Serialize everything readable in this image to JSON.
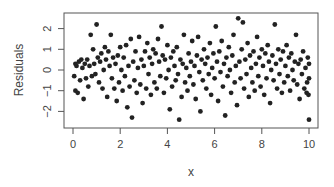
{
  "chart_data": {
    "type": "scatter",
    "title": "",
    "xlabel": "x",
    "ylabel": "Residuals",
    "xlim": [
      -0.4,
      10.4
    ],
    "ylim": [
      -2.8,
      2.8
    ],
    "xticks": [
      0,
      2,
      4,
      6,
      8,
      10
    ],
    "yticks": [
      -2,
      -1,
      0,
      1,
      2
    ],
    "grid": false,
    "legend": null,
    "marker_color": "#222222",
    "series": [
      {
        "name": "residuals",
        "points": [
          [
            0.05,
            -0.3
          ],
          [
            0.1,
            0.3
          ],
          [
            0.1,
            -1.0
          ],
          [
            0.15,
            0.2
          ],
          [
            0.2,
            -1.1
          ],
          [
            0.25,
            0.4
          ],
          [
            0.3,
            -0.5
          ],
          [
            0.35,
            0.5
          ],
          [
            0.4,
            0.1
          ],
          [
            0.45,
            -1.4
          ],
          [
            0.5,
            0.3
          ],
          [
            0.55,
            -0.4
          ],
          [
            0.6,
            0.5
          ],
          [
            0.65,
            -0.8
          ],
          [
            0.7,
            0.2
          ],
          [
            0.75,
            1.7
          ],
          [
            0.8,
            -0.3
          ],
          [
            0.85,
            1.0
          ],
          [
            0.9,
            0.3
          ],
          [
            0.95,
            -0.2
          ],
          [
            1.0,
            2.2
          ],
          [
            1.05,
            0.6
          ],
          [
            1.1,
            -0.6
          ],
          [
            1.15,
            0.4
          ],
          [
            1.2,
            0.8
          ],
          [
            1.25,
            -0.9
          ],
          [
            1.3,
            0.0
          ],
          [
            1.35,
            1.1
          ],
          [
            1.4,
            0.5
          ],
          [
            1.45,
            -1.3
          ],
          [
            1.5,
            0.9
          ],
          [
            1.55,
            0.2
          ],
          [
            1.6,
            1.7
          ],
          [
            1.65,
            -0.4
          ],
          [
            1.7,
            0.6
          ],
          [
            1.75,
            -0.9
          ],
          [
            1.8,
            0.3
          ],
          [
            1.85,
            -1.5
          ],
          [
            1.9,
            0.7
          ],
          [
            1.95,
            -0.6
          ],
          [
            2.0,
            1.1
          ],
          [
            2.05,
            0.0
          ],
          [
            2.1,
            -1.0
          ],
          [
            2.15,
            0.6
          ],
          [
            2.2,
            -0.3
          ],
          [
            2.25,
            1.2
          ],
          [
            2.3,
            -1.8
          ],
          [
            2.35,
            0.2
          ],
          [
            2.4,
            -0.8
          ],
          [
            2.45,
            1.5
          ],
          [
            2.5,
            -2.3
          ],
          [
            2.55,
            0.4
          ],
          [
            2.6,
            -0.5
          ],
          [
            2.65,
            0.9
          ],
          [
            2.7,
            -1.1
          ],
          [
            2.75,
            0.1
          ],
          [
            2.8,
            1.6
          ],
          [
            2.85,
            -0.7
          ],
          [
            2.9,
            0.5
          ],
          [
            2.95,
            -1.6
          ],
          [
            3.0,
            0.2
          ],
          [
            3.05,
            0.9
          ],
          [
            3.1,
            -0.9
          ],
          [
            3.15,
            1.3
          ],
          [
            3.2,
            -0.2
          ],
          [
            3.25,
            0.6
          ],
          [
            3.3,
            -1.2
          ],
          [
            3.35,
            0.3
          ],
          [
            3.4,
            1.0
          ],
          [
            3.45,
            -0.6
          ],
          [
            3.5,
            0.8
          ],
          [
            3.55,
            -0.9
          ],
          [
            3.6,
            1.5
          ],
          [
            3.65,
            0.4
          ],
          [
            3.7,
            -0.3
          ],
          [
            3.75,
            2.1
          ],
          [
            3.8,
            0.7
          ],
          [
            3.85,
            -1.1
          ],
          [
            3.9,
            0.5
          ],
          [
            3.95,
            -0.4
          ],
          [
            4.0,
            1.2
          ],
          [
            4.05,
            0.0
          ],
          [
            4.1,
            -1.9
          ],
          [
            4.15,
            0.6
          ],
          [
            4.2,
            -0.8
          ],
          [
            4.25,
            0.9
          ],
          [
            4.3,
            0.2
          ],
          [
            4.35,
            -0.5
          ],
          [
            4.4,
            1.1
          ],
          [
            4.45,
            -0.2
          ],
          [
            4.5,
            -2.4
          ],
          [
            4.55,
            0.5
          ],
          [
            4.6,
            -1.3
          ],
          [
            4.65,
            0.3
          ],
          [
            4.7,
            1.7
          ],
          [
            4.75,
            -0.6
          ],
          [
            4.8,
            0.1
          ],
          [
            4.85,
            -1.0
          ],
          [
            4.9,
            0.8
          ],
          [
            4.95,
            -0.3
          ],
          [
            5.0,
            0.4
          ],
          [
            5.05,
            1.4
          ],
          [
            5.1,
            -0.7
          ],
          [
            5.15,
            0.2
          ],
          [
            5.2,
            -1.4
          ],
          [
            5.25,
            0.7
          ],
          [
            5.3,
            1.6
          ],
          [
            5.35,
            -0.1
          ],
          [
            5.4,
            -2.0
          ],
          [
            5.45,
            0.5
          ],
          [
            5.5,
            -0.5
          ],
          [
            5.55,
            1.0
          ],
          [
            5.6,
            0.3
          ],
          [
            5.65,
            -0.9
          ],
          [
            5.7,
            0.6
          ],
          [
            5.75,
            -0.2
          ],
          [
            5.8,
            1.3
          ],
          [
            5.85,
            -1.2
          ],
          [
            5.9,
            0.1
          ],
          [
            5.95,
            0.8
          ],
          [
            6.0,
            -0.4
          ],
          [
            6.05,
            2.1
          ],
          [
            6.1,
            0.4
          ],
          [
            6.15,
            -1.5
          ],
          [
            6.2,
            0.9
          ],
          [
            6.25,
            -0.1
          ],
          [
            6.3,
            1.4
          ],
          [
            6.35,
            -0.8
          ],
          [
            6.4,
            0.3
          ],
          [
            6.45,
            -2.2
          ],
          [
            6.5,
            0.6
          ],
          [
            6.55,
            -0.3
          ],
          [
            6.6,
            1.1
          ],
          [
            6.65,
            0.0
          ],
          [
            6.7,
            -1.1
          ],
          [
            6.75,
            0.7
          ],
          [
            6.8,
            1.7
          ],
          [
            6.85,
            -0.6
          ],
          [
            6.9,
            0.2
          ],
          [
            6.95,
            -1.7
          ],
          [
            7.0,
            2.5
          ],
          [
            7.05,
            0.4
          ],
          [
            7.1,
            -0.4
          ],
          [
            7.15,
            1.0
          ],
          [
            7.2,
            2.3
          ],
          [
            7.25,
            -0.9
          ],
          [
            7.3,
            0.5
          ],
          [
            7.35,
            -0.2
          ],
          [
            7.4,
            1.3
          ],
          [
            7.45,
            -1.3
          ],
          [
            7.5,
            0.7
          ],
          [
            7.55,
            0.1
          ],
          [
            7.6,
            -0.6
          ],
          [
            7.65,
            0.9
          ],
          [
            7.7,
            -1.0
          ],
          [
            7.75,
            0.3
          ],
          [
            7.8,
            1.6
          ],
          [
            7.85,
            -0.3
          ],
          [
            7.9,
            0.6
          ],
          [
            7.95,
            -0.8
          ],
          [
            8.0,
            1.0
          ],
          [
            8.05,
            0.2
          ],
          [
            8.1,
            -1.2
          ],
          [
            8.15,
            0.8
          ],
          [
            8.2,
            -0.4
          ],
          [
            8.25,
            1.2
          ],
          [
            8.3,
            0.4
          ],
          [
            8.35,
            -1.6
          ],
          [
            8.4,
            0.0
          ],
          [
            8.45,
            0.7
          ],
          [
            8.5,
            -0.5
          ],
          [
            8.55,
            2.2
          ],
          [
            8.6,
            0.3
          ],
          [
            8.65,
            -0.9
          ],
          [
            8.7,
            1.0
          ],
          [
            8.75,
            -0.2
          ],
          [
            8.8,
            0.5
          ],
          [
            8.85,
            -1.1
          ],
          [
            8.9,
            0.9
          ],
          [
            8.95,
            -0.6
          ],
          [
            9.0,
            0.2
          ],
          [
            9.05,
            1.2
          ],
          [
            9.1,
            -0.3
          ],
          [
            9.15,
            0.6
          ],
          [
            9.2,
            -1.0
          ],
          [
            9.25,
            0.8
          ],
          [
            9.3,
            0.0
          ],
          [
            9.35,
            -0.5
          ],
          [
            9.4,
            0.4
          ],
          [
            9.45,
            1.7
          ],
          [
            9.5,
            -0.7
          ],
          [
            9.55,
            0.3
          ],
          [
            9.6,
            -1.4
          ],
          [
            9.65,
            0.5
          ],
          [
            9.7,
            -0.2
          ],
          [
            9.75,
            0.9
          ],
          [
            9.8,
            -0.9
          ],
          [
            9.85,
            0.1
          ],
          [
            9.9,
            -1.1
          ],
          [
            9.95,
            0.6
          ],
          [
            10.0,
            -0.4
          ],
          [
            10.0,
            0.3
          ],
          [
            10.0,
            -2.4
          ],
          [
            9.98,
            -1.2
          ],
          [
            9.92,
            -0.6
          ]
        ]
      }
    ]
  }
}
